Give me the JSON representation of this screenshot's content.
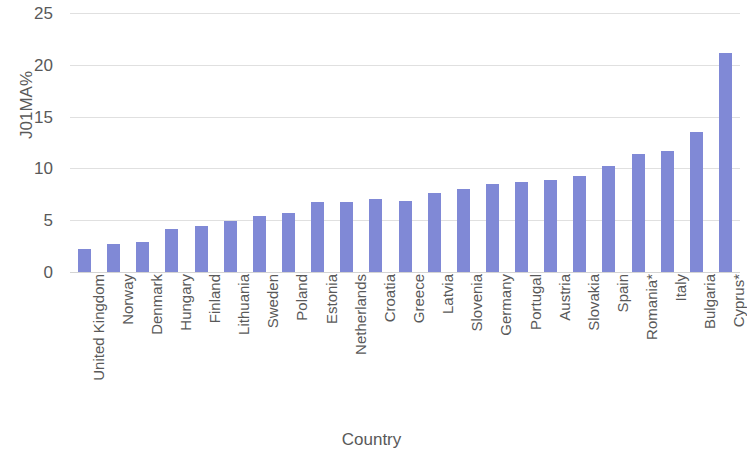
{
  "chart_data": {
    "type": "bar",
    "title": "",
    "xlabel": "Country",
    "ylabel": "J01MA%",
    "ylim": [
      0,
      25
    ],
    "yticks": [
      0,
      5,
      10,
      15,
      20,
      25
    ],
    "grid": true,
    "legend": "none",
    "bar_color": "#8089d6",
    "categories": [
      "United Kingdom",
      "Norway",
      "Denmark",
      "Hungary",
      "Finland",
      "Lithuania",
      "Sweden",
      "Poland",
      "Estonia",
      "Netherlands",
      "Croatia",
      "Greece",
      "Latvia",
      "Slovenia",
      "Germany",
      "Portugal",
      "Austria",
      "Slovakia",
      "Spain",
      "Romania*",
      "Italy",
      "Bulgaria",
      "Cyprus*"
    ],
    "values": [
      2.2,
      2.7,
      2.9,
      4.2,
      4.4,
      4.9,
      5.4,
      5.7,
      6.8,
      6.8,
      7.0,
      6.9,
      7.6,
      8.0,
      8.5,
      8.7,
      8.9,
      9.3,
      10.2,
      11.4,
      11.7,
      13.5,
      21.1
    ]
  },
  "axes": {
    "y_tick_labels": [
      "25",
      "20",
      "15",
      "10",
      "5",
      "0"
    ],
    "y_axis_title": "J01MA%",
    "x_axis_title": "Country"
  }
}
